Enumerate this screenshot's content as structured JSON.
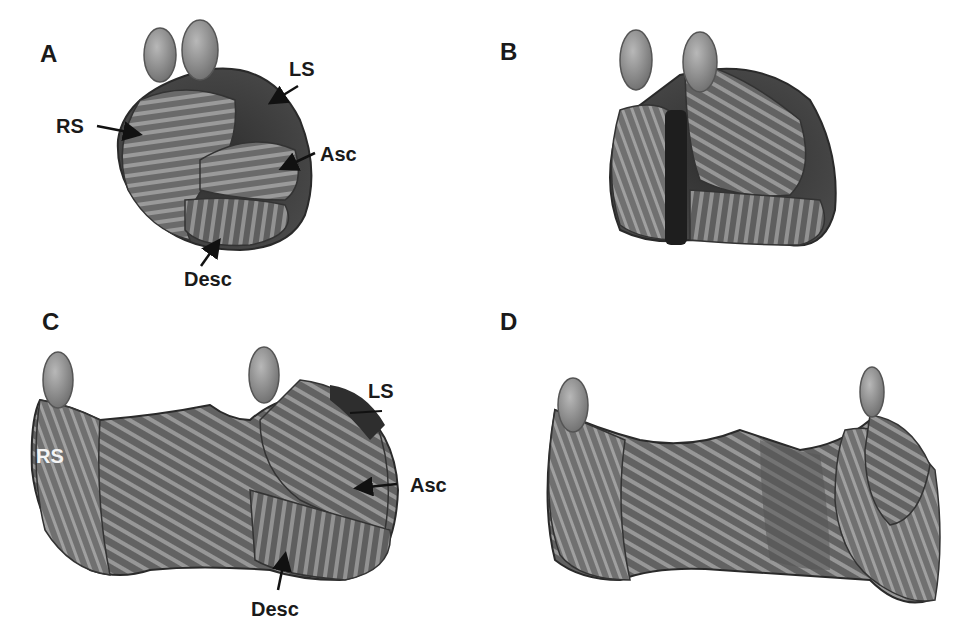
{
  "figure": {
    "panels": [
      {
        "id": "A",
        "letter": "A",
        "labels": {
          "ls": "LS",
          "rs": "RS",
          "asc": "Asc",
          "desc": "Desc"
        }
      },
      {
        "id": "B",
        "letter": "B"
      },
      {
        "id": "C",
        "letter": "C",
        "labels": {
          "ls": "LS",
          "rs": "RS",
          "asc": "Asc",
          "desc": "Desc"
        }
      },
      {
        "id": "D",
        "letter": "D"
      }
    ],
    "colors": {
      "background": "#ffffff",
      "tissue_dark": "#3a3a3a",
      "tissue_mid": "#6e6e6e",
      "tissue_light": "#9a9a9a",
      "text": "#1a1a1a"
    }
  }
}
